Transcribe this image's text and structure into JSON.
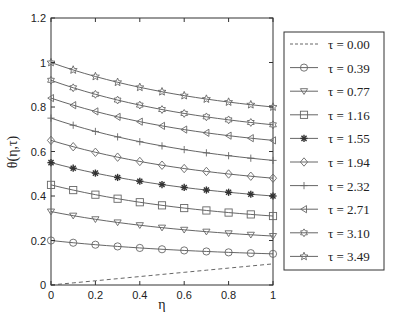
{
  "chart_data": {
    "type": "line",
    "title": "",
    "xlabel": "η",
    "ylabel": "θ(η,τ)",
    "xlim": [
      0,
      1
    ],
    "ylim": [
      0,
      1.2
    ],
    "xticks": [
      0,
      0.2,
      0.4,
      0.6,
      0.8,
      1
    ],
    "xtick_labels": [
      "0",
      "0.2",
      "0.4",
      "0.6",
      "0.8",
      "1"
    ],
    "yticks": [
      0,
      0.2,
      0.4,
      0.6,
      0.8,
      1,
      1.2
    ],
    "ytick_labels": [
      "0",
      "0.2",
      "0.4",
      "0.6",
      "0.8",
      "1",
      "1.2"
    ],
    "grid": false,
    "legend_position": "right-outside",
    "x": [
      0,
      0.05,
      0.1,
      0.15,
      0.2,
      0.25,
      0.3,
      0.35,
      0.4,
      0.45,
      0.5,
      0.55,
      0.6,
      0.65,
      0.7,
      0.75,
      0.8,
      0.85,
      0.9,
      0.95,
      1.0
    ],
    "series": [
      {
        "name": "τ = 0.00",
        "marker": "none",
        "dashed": true,
        "start": 0.0,
        "end": 0.095
      },
      {
        "name": "τ = 0.39",
        "marker": "circle",
        "dashed": false,
        "start": 0.2,
        "end": 0.14
      },
      {
        "name": "τ = 0.77",
        "marker": "triangle-down",
        "dashed": false,
        "start": 0.33,
        "end": 0.22
      },
      {
        "name": "τ = 1.16",
        "marker": "square",
        "dashed": false,
        "start": 0.45,
        "end": 0.31
      },
      {
        "name": "τ = 1.55",
        "marker": "asterisk",
        "dashed": false,
        "start": 0.55,
        "end": 0.4
      },
      {
        "name": "τ = 1.94",
        "marker": "diamond",
        "dashed": false,
        "start": 0.65,
        "end": 0.48
      },
      {
        "name": "τ = 2.32",
        "marker": "plus",
        "dashed": false,
        "start": 0.75,
        "end": 0.56
      },
      {
        "name": "τ = 2.71",
        "marker": "triangle-left",
        "dashed": false,
        "start": 0.84,
        "end": 0.65
      },
      {
        "name": "τ = 3.10",
        "marker": "hexagram",
        "dashed": false,
        "start": 0.92,
        "end": 0.72
      },
      {
        "name": "τ = 3.49",
        "marker": "pentagram",
        "dashed": false,
        "start": 1.0,
        "end": 0.8
      }
    ],
    "colors": {
      "line": "#555555",
      "marker": "#666666",
      "asterisk": "#333333",
      "axis": "#333333"
    }
  }
}
